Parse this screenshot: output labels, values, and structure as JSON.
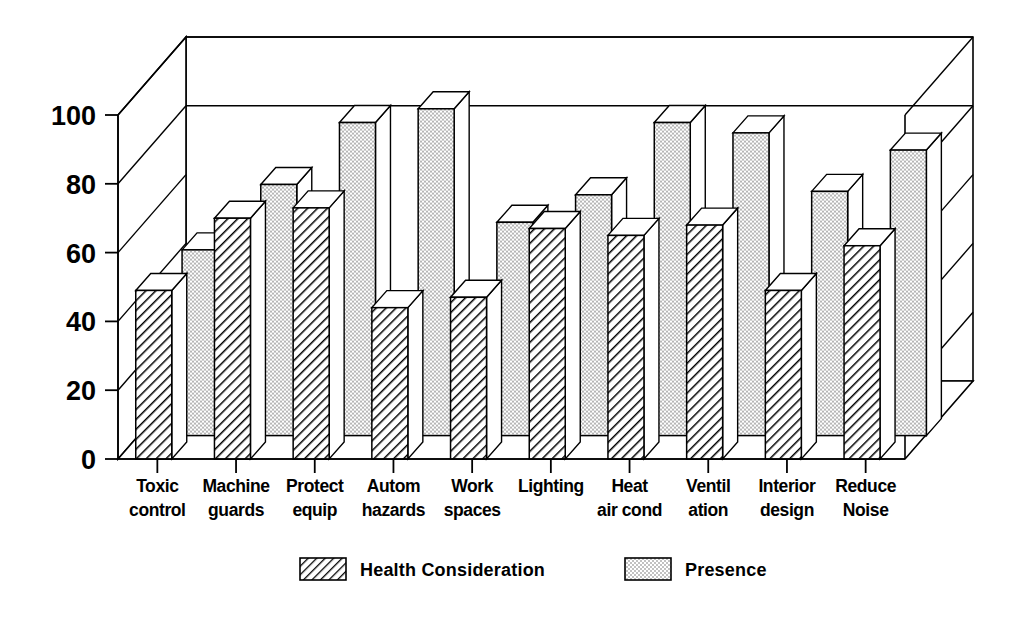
{
  "chart_data": {
    "type": "bar",
    "title": "",
    "subtitle": "",
    "xlabel": "",
    "ylabel": "",
    "ylim": [
      0,
      100
    ],
    "yticks": [
      0,
      20,
      40,
      60,
      80,
      100
    ],
    "grid": true,
    "style": "3d-clustered-bar",
    "legend_position": "bottom",
    "categories": [
      "Toxic control",
      "Machine guards",
      "Protect equip",
      "Autom hazards",
      "Work spaces",
      "Lighting",
      "Heat air cond",
      "Ventil ation",
      "Interior design",
      "Reduce Noise"
    ],
    "category_lines": [
      [
        "Toxic",
        "control"
      ],
      [
        "Machine",
        "guards"
      ],
      [
        "Protect",
        "equip"
      ],
      [
        "Autom",
        "hazards"
      ],
      [
        "Work",
        "spaces"
      ],
      [
        "Lighting",
        ""
      ],
      [
        "Heat",
        "air cond"
      ],
      [
        "Ventil",
        "ation"
      ],
      [
        "Interior",
        "design"
      ],
      [
        "Reduce",
        "Noise"
      ]
    ],
    "series": [
      {
        "name": "Health Consideration",
        "pattern": "diagonal-hatch",
        "values": [
          49,
          70,
          73,
          44,
          47,
          67,
          65,
          68,
          49,
          62
        ]
      },
      {
        "name": "Presence",
        "pattern": "dotted",
        "values": [
          54,
          73,
          91,
          95,
          62,
          70,
          91,
          88,
          71,
          83
        ]
      }
    ]
  },
  "legend": {
    "items": [
      {
        "label": "Health Consideration",
        "pattern": "diagonal-hatch"
      },
      {
        "label": "Presence",
        "pattern": "dotted"
      }
    ]
  },
  "axes": {
    "y_tick_labels": [
      "0",
      "20",
      "40",
      "60",
      "80",
      "100"
    ]
  },
  "colors": {
    "stroke": "#000000",
    "background": "#ffffff",
    "bar_face": "#ffffff",
    "bar_top": "#ffffff"
  }
}
